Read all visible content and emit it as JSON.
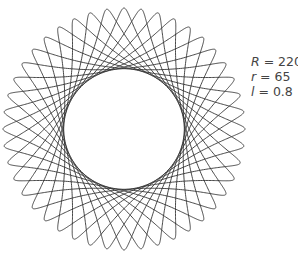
{
  "figure": {
    "type": "spirograph",
    "curve": "hypotrochoid",
    "stroke_color": "#333333",
    "background": "#ffffff"
  },
  "params": {
    "R": {
      "symbol": "R",
      "eq": " = ",
      "value": "220"
    },
    "r": {
      "symbol": "r",
      "eq": " = ",
      "value": "65"
    },
    "l": {
      "symbol": "l",
      "eq": " = ",
      "value": "0.8"
    }
  },
  "chart_data": {
    "type": "line",
    "title": "",
    "annotations": [
      "R = 220",
      "r = 65",
      "l = 0.8"
    ],
    "R": 220,
    "r": 65,
    "l": 0.8,
    "lobes": 44,
    "center_px": [
      124,
      129
    ],
    "outer_radius_px": 121,
    "inner_radius_px": 59
  }
}
